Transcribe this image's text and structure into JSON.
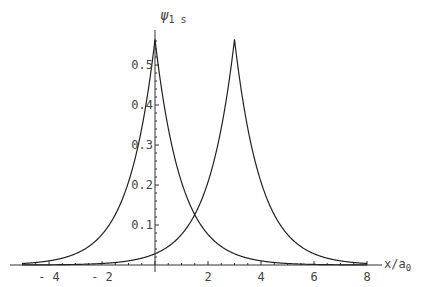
{
  "chart_data": {
    "type": "line",
    "title": "",
    "xlabel": "x/a0",
    "ylabel": "ψ1 s",
    "xlim": [
      -5,
      8
    ],
    "ylim": [
      0,
      0.57
    ],
    "grid": false,
    "legend": "none",
    "x_ticks": [
      -4,
      -2,
      2,
      4,
      6,
      8
    ],
    "x_tick_labels": [
      "-4",
      "-2",
      "2",
      "4",
      "6",
      "8"
    ],
    "y_ticks": [
      0.1,
      0.2,
      0.3,
      0.4,
      0.5
    ],
    "y_tick_labels": [
      "0.1",
      "0.2",
      "0.3",
      "0.4",
      "0.5"
    ],
    "series": [
      {
        "name": "ψ1s centered at 0",
        "formula": "exp(-|x|)/sqrt(pi)",
        "center": 0,
        "peak": 0.564,
        "x": [
          -5,
          -4,
          -3,
          -2,
          -1,
          0,
          1,
          2,
          3,
          4,
          5,
          6,
          7,
          8
        ],
        "values": [
          0.004,
          0.01,
          0.028,
          0.076,
          0.208,
          0.564,
          0.208,
          0.076,
          0.028,
          0.01,
          0.004,
          0.001,
          0.001,
          0.0
        ]
      },
      {
        "name": "ψ1s centered at 3",
        "formula": "exp(-|x-3|)/sqrt(pi)",
        "center": 3,
        "peak": 0.564,
        "x": [
          -5,
          -4,
          -3,
          -2,
          -1,
          0,
          1,
          2,
          3,
          4,
          5,
          6,
          7,
          8
        ],
        "values": [
          0.0,
          0.001,
          0.001,
          0.004,
          0.01,
          0.028,
          0.076,
          0.208,
          0.564,
          0.208,
          0.076,
          0.028,
          0.01,
          0.004
        ]
      }
    ]
  },
  "axes": {
    "x_label_main": "x/a",
    "x_label_sub": "0",
    "y_label_main": "ψ",
    "y_label_sub": "1 s"
  }
}
